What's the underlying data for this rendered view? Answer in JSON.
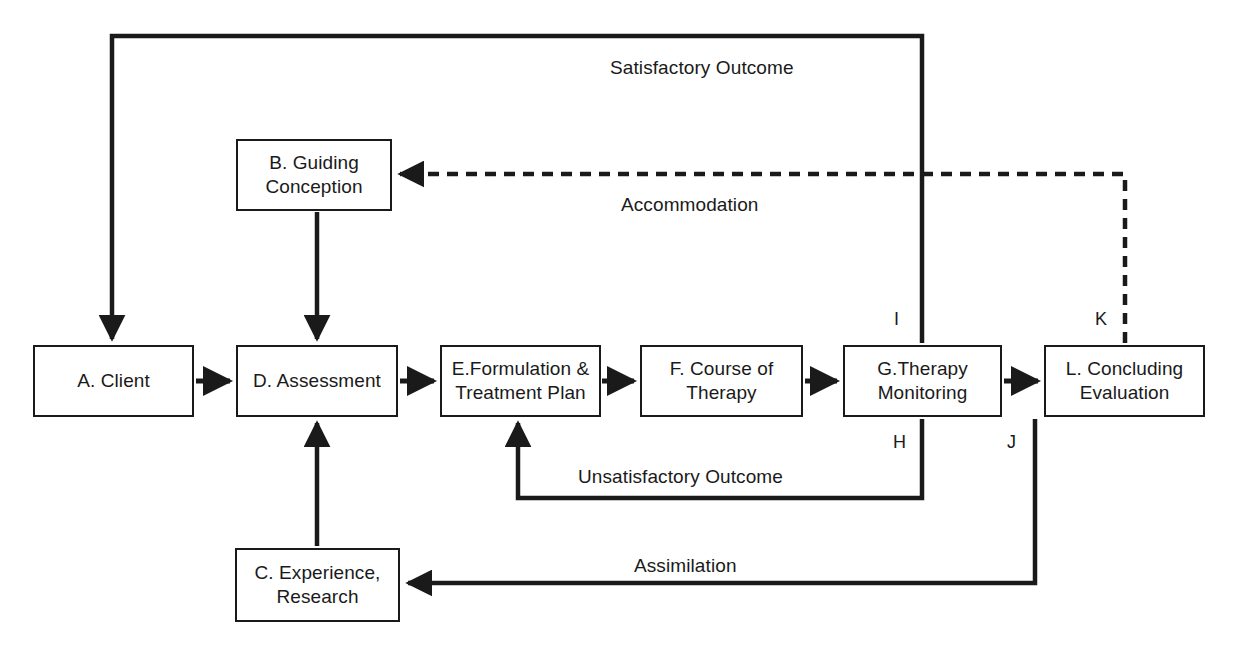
{
  "diagram": {
    "stroke_color": "#1a1a1a",
    "background_color": "#ffffff",
    "nodes": [
      {
        "id": "A",
        "label": "A. Client"
      },
      {
        "id": "B",
        "label": "B. Guiding\nConception"
      },
      {
        "id": "C",
        "label": "C. Experience,\nResearch"
      },
      {
        "id": "D",
        "label": "D. Assessment"
      },
      {
        "id": "E",
        "label": "E.Formulation &\nTreatment Plan"
      },
      {
        "id": "F",
        "label": "F. Course of\nTherapy"
      },
      {
        "id": "G",
        "label": "G.Therapy\nMonitoring"
      },
      {
        "id": "L",
        "label": "L. Concluding\nEvaluation"
      }
    ],
    "edge_labels": [
      {
        "id": "satisfactory",
        "text": "Satisfactory Outcome"
      },
      {
        "id": "accommodation",
        "text": "Accommodation"
      },
      {
        "id": "unsatisfactory",
        "text": "Unsatisfactory Outcome"
      },
      {
        "id": "assimilation",
        "text": "Assimilation"
      }
    ],
    "point_labels": [
      {
        "id": "H",
        "text": "H"
      },
      {
        "id": "I",
        "text": "I"
      },
      {
        "id": "J",
        "text": "J"
      },
      {
        "id": "K",
        "text": "K"
      }
    ]
  }
}
